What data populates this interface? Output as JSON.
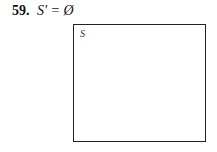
{
  "problem": {
    "number": "59.",
    "expression": "S' = Ø"
  },
  "diagram": {
    "universal_set_label": "S",
    "shaded": false
  }
}
